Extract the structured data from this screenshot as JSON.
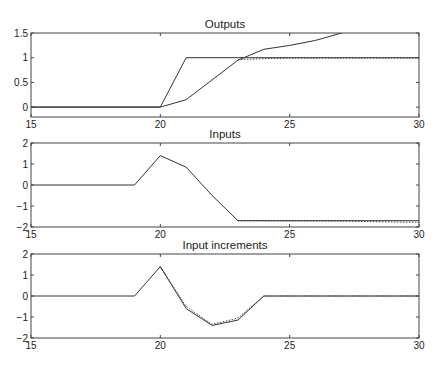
{
  "chart_data": [
    {
      "type": "line",
      "title": "Outputs",
      "xlabel": "",
      "ylabel": "",
      "xlim": [
        15,
        30
      ],
      "ylim": [
        -0.2,
        1.5
      ],
      "xticks": [
        15,
        20,
        25,
        30
      ],
      "yticks": [
        0,
        0.5,
        1,
        1.5
      ],
      "grid": false,
      "legend": null,
      "series": [
        {
          "name": "output",
          "style": "solid",
          "x": [
            15,
            20,
            21,
            22,
            23,
            24,
            25,
            26,
            27,
            28
          ],
          "y": [
            0,
            0,
            0.15,
            0.55,
            0.95,
            1.17,
            1.25,
            1.35,
            1.5,
            1.6
          ]
        },
        {
          "name": "reference",
          "style": "solid",
          "x": [
            15,
            20,
            21,
            30
          ],
          "y": [
            0,
            0,
            1,
            1
          ]
        },
        {
          "name": "predicted",
          "style": "dotted",
          "x": [
            23,
            24,
            25,
            30
          ],
          "y": [
            0.96,
            0.98,
            0.99,
            0.99
          ]
        }
      ]
    },
    {
      "type": "line",
      "title": "Inputs",
      "xlabel": "",
      "ylabel": "",
      "xlim": [
        15,
        30
      ],
      "ylim": [
        -2,
        2
      ],
      "xticks": [
        15,
        20,
        25,
        30
      ],
      "yticks": [
        -2,
        -1,
        0,
        1,
        2
      ],
      "grid": false,
      "legend": null,
      "series": [
        {
          "name": "input",
          "style": "solid",
          "x": [
            15,
            19,
            20,
            21,
            22,
            23,
            30
          ],
          "y": [
            0,
            0,
            1.4,
            0.85,
            -0.5,
            -1.7,
            -1.7
          ]
        },
        {
          "name": "input-predicted",
          "style": "dotted",
          "x": [
            23,
            27,
            30
          ],
          "y": [
            -1.7,
            -1.72,
            -1.78
          ]
        }
      ]
    },
    {
      "type": "line",
      "title": "Input increments",
      "xlabel": "",
      "ylabel": "",
      "xlim": [
        15,
        30
      ],
      "ylim": [
        -2,
        2
      ],
      "xticks": [
        15,
        20,
        25,
        30
      ],
      "yticks": [
        -2,
        -1,
        0,
        1,
        2
      ],
      "grid": false,
      "legend": null,
      "series": [
        {
          "name": "increment",
          "style": "solid",
          "x": [
            15,
            19,
            20,
            21,
            22,
            23,
            24,
            30
          ],
          "y": [
            0,
            0,
            1.4,
            -0.6,
            -1.4,
            -1.15,
            0,
            0
          ]
        },
        {
          "name": "increment-predicted",
          "style": "dotted",
          "x": [
            20,
            21,
            22,
            23,
            24,
            30
          ],
          "y": [
            1.4,
            -0.5,
            -1.35,
            -1.05,
            0,
            0
          ]
        }
      ]
    }
  ],
  "colors": {
    "line": "#333333",
    "axis": "#444444",
    "background": "#ffffff"
  }
}
